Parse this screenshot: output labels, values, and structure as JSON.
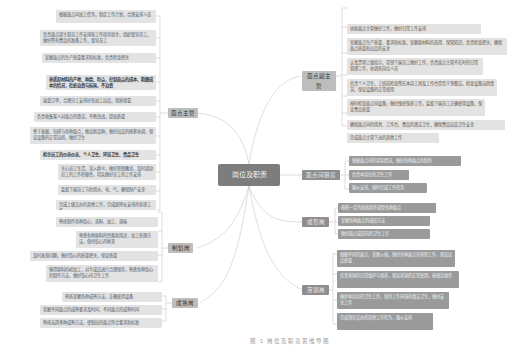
{
  "center": {
    "label": "岗位及职责"
  },
  "caption": "图 1   岗位及职责思维导图",
  "colors": {
    "background": "#ffffff",
    "center": "#7d7d7d",
    "leaf_light": "#e3e3e3",
    "leaf_dark": "#9a9a9a",
    "line": "#cccccc"
  },
  "branches": {
    "head": {
      "label": "面点主管",
      "items": [
        "根据面点间加工任务，制定工作计划，合理安排人员",
        "负责面点部主管员工作安排和工作指导指令，组织督导员工，做好所有食品的准备工作，督导员工",
        "掌握面点的生产质量要求和标准，负责检查把关",
        "熟悉原材料的产地、种类、特点，控制面点的成本，精细成本的情况，杜绝浪费与损耗，不浪费",
        "接受订单，合理分工安排好各加工出品，保质保量",
        "负责收集客人对面点的意见，不断改进，提高质量",
        "善于发掘、钻研与各种面点，推出新品种，做好出品的统筹协调，保证设备的正常运转，做好卫生",
        "检查员工的仪容仪表、个人卫生、环境卫生、食品卫生",
        "关心员工生活，深入群众，做好思想教育，及时调动员工的工作积极性，切实做好员工的工作安排",
        "监督下属员工节约用水、电、气，确保财产安全",
        "完成上级交办的其他工作，完成厨师长安排的各项工作"
      ]
    },
    "deputy": {
      "label": "面点副主管",
      "items": [
        "协助面点主管做好工作，做好日常工作安排",
        "掌握面点生产质量、要求和标准，掌握原材料的选用、保管知识，负责检查把关，确保面点质量和出品的安全",
        "认真贯彻上级指示，带领下属员工做好工作，负责面点主管不在时的日常管理工作，协调各岗位人员",
        "负责个人卫生，上班前检查所在本岗工具及工作台是否干净整洁，检查设备运转情况，保证设备的正常使用",
        "按时检查面点间设备，做好维修保养工作，监督下属员工正确使用设备，保证食品质量",
        "确保面点间的用具、工作台、食品的清洁卫生，确保食品出品卫生安全",
        "完成面点主管下达的其他工作"
      ]
    },
    "kitchen": {
      "label": "面点间厨房",
      "items": [
        "根据面点间的实际情况，做好各种面点的制作",
        "负责本岗位的卫生工作",
        "服从安排，按时完成工作任务"
      ]
    },
    "forming": {
      "label": "成形岗",
      "items": [
        "按照一定的规格制作成型各种面点",
        "掌握各种面点的成形方法",
        "做好面点成形岗的卫生工作"
      ]
    },
    "steaming": {
      "label": "蒸锅岗",
      "items": [
        "根据不同的面点，掌握火候，做好各种面点的蒸制工作，保证出品质量",
        "负责蒸锅的日常维护与保养，保证蒸锅的正常使用，按规定操作",
        "做好本岗位的卫生工作，保持工作环境的清洁卫生，做好安全工作",
        "完成领导交办的其他工作任务，服从安排"
      ]
    },
    "filling": {
      "label": "制馅岗",
      "items": [
        "熟练制作各种馅心，选料、加工、调味",
        "熟悉各种原料的性能和用途，加工处理方法，保持馅心的鲜美",
        "及时发现问题，做好馅心的质量把关，保证质量",
        "懂得原料的初加工，对半成品进行合理保存，熟悉各种馅心的制作方法，做好馅心间卫生工作"
      ]
    },
    "cooking": {
      "label": "成熟岗",
      "items": [
        "熟练掌握各种成熟方法，正确使用设备",
        "掌握不同面点的成熟要求及时间，不同面点的成熟时间",
        "熟练运用多种成熟方法，使制出的面点符合要求和标准"
      ]
    }
  }
}
